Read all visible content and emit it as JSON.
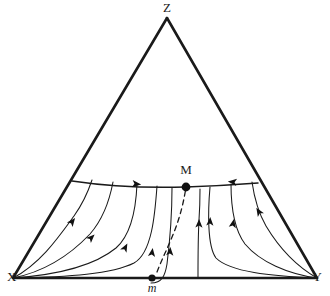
{
  "figure": {
    "type": "phase-portrait",
    "background_color": "#ffffff",
    "line_color": "#1a1a1a",
    "point_color": "#111111",
    "width": 330,
    "height": 296
  },
  "vertices": [
    {
      "id": "Z",
      "label": "Z",
      "x": 167,
      "y": 18,
      "label_x": 167,
      "label_y": 12,
      "role": "apex"
    },
    {
      "id": "X",
      "label": "X",
      "x": 13,
      "y": 278,
      "label_x": 7,
      "label_y": 281,
      "role": "bottom-left"
    },
    {
      "id": "Y",
      "label": "Y",
      "x": 317,
      "y": 278,
      "label_x": 322,
      "label_y": 281,
      "role": "bottom-right"
    }
  ],
  "equilibria": [
    {
      "id": "M",
      "label": "M",
      "x": 186,
      "y": 187,
      "label_x": 186,
      "label_y": 174,
      "radius": 4.4,
      "type": "interior-saddle"
    },
    {
      "id": "m",
      "label": "m",
      "x": 152,
      "y": 278,
      "label_x": 152,
      "label_y": 292,
      "radius": 3.6,
      "type": "boundary-point",
      "italic": true
    }
  ],
  "separatrix_arc": {
    "name": "stable-manifold-arc",
    "from_x": 72,
    "from_y": 181,
    "to_x": 258,
    "to_y": 183,
    "through_x": 186,
    "through_y": 187,
    "style": "solid"
  },
  "separatrix_dashed": {
    "name": "dashed-separatrix-m-to-M",
    "from_x": 157,
    "from_y": 272,
    "to_x": 186,
    "to_y": 187,
    "style": "dashed"
  },
  "trajectories": [
    {
      "id": "t1",
      "d": "M 13 278 C 40 264 58 238 74 216 C 84 202 88 192 92 180",
      "arrows": [
        {
          "x": 72,
          "y": 222,
          "angle": -52
        }
      ]
    },
    {
      "id": "t2",
      "d": "M 13 278 C 48 271 72 253 90 234 C 104 218 110 198 113 182",
      "arrows": [
        {
          "x": 91,
          "y": 238,
          "angle": -44
        }
      ]
    },
    {
      "id": "t3",
      "d": "M 13 278 C 56 275 94 266 116 248 C 132 234 136 208 137 184",
      "arrows": [
        {
          "x": 125,
          "y": 248,
          "angle": -62
        }
      ]
    },
    {
      "id": "t4",
      "d": "M 13 278 C 70 277 112 274 134 263 C 152 253 155 214 157 186",
      "arrows": [
        {
          "x": 152,
          "y": 253,
          "angle": -82
        }
      ]
    },
    {
      "id": "t5",
      "d": "M 151 283 C 162 283 165 276 167 264 C 170 240 172 210 172 188",
      "arrows": [
        {
          "x": 170,
          "y": 252,
          "angle": -86
        }
      ]
    },
    {
      "id": "t6",
      "d": "M 198 277 C 198 260 198 238 199 220 C 200 206 200 196 200 189",
      "arrows": [
        {
          "x": 199,
          "y": 224,
          "angle": -89
        }
      ]
    },
    {
      "id": "t7",
      "d": "M 317 278 C 270 276 230 272 216 258 C 207 246 208 210 210 187",
      "arrows": [
        {
          "x": 210,
          "y": 222,
          "angle": -87
        }
      ]
    },
    {
      "id": "t8",
      "d": "M 317 278 C 288 274 260 262 245 244 C 233 228 231 202 231 184",
      "arrows": [
        {
          "x": 233,
          "y": 224,
          "angle": -79
        }
      ]
    },
    {
      "id": "t9",
      "d": "M 317 278 C 296 266 278 246 266 226 C 258 212 254 196 252 182",
      "arrows": [
        {
          "x": 259,
          "y": 212,
          "angle": -122
        }
      ]
    }
  ],
  "arc_arrows": [
    {
      "x": 136,
      "y": 184,
      "angle": 6,
      "direction": "toward-M-from-left"
    },
    {
      "x": 233,
      "y": 182,
      "angle": 186,
      "direction": "toward-M-from-right"
    }
  ]
}
